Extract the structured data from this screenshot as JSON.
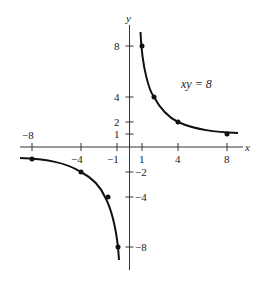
{
  "diagram": {
    "equation_label": "xy = 8",
    "x_axis": {
      "label": "x",
      "ticks": [
        -8,
        -4,
        -1,
        1,
        4,
        8
      ],
      "tick_labels": [
        "−8",
        "−4",
        "−1",
        "1",
        "4",
        "8"
      ]
    },
    "y_axis": {
      "label": "y",
      "ticks": [
        8,
        4,
        2,
        1,
        -2,
        -4,
        -8
      ],
      "tick_labels": [
        "8",
        "4",
        "2",
        "1",
        "−2",
        "−4",
        "−8"
      ]
    },
    "branches": [
      {
        "name": "first-quadrant",
        "points": [
          [
            1,
            8
          ],
          [
            2,
            4
          ],
          [
            4,
            2
          ],
          [
            8,
            1
          ]
        ]
      },
      {
        "name": "third-quadrant",
        "points": [
          [
            -8,
            -1
          ],
          [
            -4,
            -2
          ],
          [
            -2,
            -4
          ],
          [
            -1,
            -8
          ]
        ]
      }
    ],
    "colors": {
      "ink": "#111111",
      "axis": "#333333",
      "background": "#ffffff"
    }
  }
}
